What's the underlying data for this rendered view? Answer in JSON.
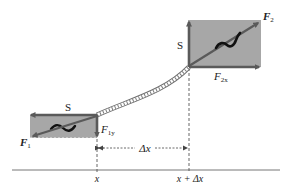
{
  "diagram": {
    "type": "physics-free-body",
    "colors": {
      "box_fill": "#a7a7a7",
      "arrow": "#5a5a5a",
      "string": "#6e6e6e",
      "text": "#222222",
      "baseline": "#777777"
    },
    "left_element": {
      "tension_label": "S",
      "force_label": "F",
      "force_subscript": "1",
      "component_label": "F",
      "component_subscript": "1y"
    },
    "right_element": {
      "tension_label": "S",
      "force_label": "F",
      "force_subscript": "2",
      "component_label": "F",
      "component_subscript": "2x"
    },
    "dimension": {
      "label": "Δx"
    },
    "axis": {
      "left_tick_label": "x",
      "right_tick_label": "x + Δx"
    }
  }
}
